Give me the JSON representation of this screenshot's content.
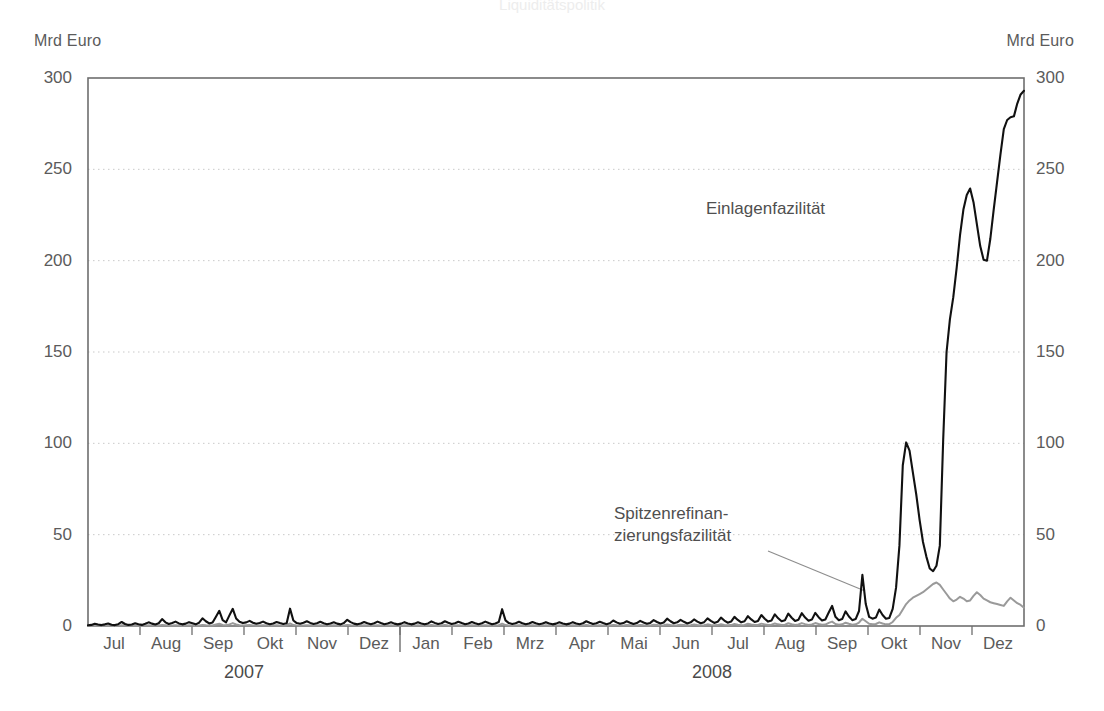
{
  "figure": {
    "faint_top_title": "Liquiditätspolitik",
    "unit_label_left": "Mrd Euro",
    "unit_label_right": "Mrd Euro"
  },
  "chart_data": {
    "type": "line",
    "title": "",
    "xlabel": "",
    "ylabel": "Mrd Euro",
    "ylim": [
      0,
      300
    ],
    "yticks": [
      0,
      50,
      100,
      150,
      200,
      250,
      300
    ],
    "ytick_labels": [
      "0",
      "50",
      "100",
      "150",
      "200",
      "250",
      "300"
    ],
    "grid": true,
    "grid_axis": "y",
    "legend_position": "inline-annotations",
    "x_tick_labels": [
      "Jul",
      "Aug",
      "Sep",
      "Okt",
      "Nov",
      "Dez",
      "Jan",
      "Feb",
      "Mrz",
      "Apr",
      "Mai",
      "Jun",
      "Jul",
      "Aug",
      "Sep",
      "Okt",
      "Nov",
      "Dez"
    ],
    "year_groups": [
      {
        "label": "2007",
        "start_index": 0,
        "end_index": 5
      },
      {
        "label": "2008",
        "start_index": 6,
        "end_index": 17
      }
    ],
    "colors": {
      "deposit_facility": "#111111",
      "marginal_lending_facility": "#9a9a9a"
    },
    "series": [
      {
        "name": "Einlagenfazilität",
        "color": "#111111",
        "annotation": "Einlagenfazilität",
        "values": [
          0.4,
          0.6,
          1.2,
          0.8,
          0.5,
          0.9,
          1.4,
          0.7,
          0.5,
          1.0,
          2.2,
          1.1,
          0.6,
          0.8,
          1.5,
          1.0,
          0.6,
          1.2,
          2.0,
          1.3,
          0.8,
          1.5,
          3.8,
          2.0,
          1.1,
          1.6,
          2.4,
          1.4,
          0.9,
          1.3,
          2.1,
          1.5,
          0.9,
          1.8,
          4.2,
          2.6,
          1.4,
          1.9,
          5.1,
          8.3,
          3.2,
          2.0,
          5.8,
          9.4,
          4.1,
          2.3,
          1.6,
          2.0,
          2.8,
          1.8,
          1.2,
          1.6,
          2.4,
          1.5,
          1.0,
          1.4,
          2.2,
          1.6,
          1.1,
          1.5,
          9.5,
          3.0,
          1.6,
          1.2,
          1.8,
          2.6,
          1.7,
          1.1,
          1.5,
          2.3,
          1.5,
          1.0,
          1.4,
          2.0,
          1.3,
          0.9,
          1.6,
          3.4,
          2.1,
          1.3,
          0.9,
          1.4,
          2.2,
          1.5,
          1.0,
          1.5,
          2.4,
          1.6,
          1.0,
          1.4,
          2.0,
          1.3,
          0.9,
          1.3,
          2.1,
          1.4,
          0.9,
          1.3,
          2.0,
          1.4,
          0.9,
          1.4,
          2.5,
          1.7,
          1.1,
          1.5,
          2.6,
          1.8,
          1.1,
          1.5,
          2.3,
          1.6,
          1.0,
          1.4,
          2.2,
          1.5,
          1.0,
          1.5,
          2.4,
          1.6,
          1.0,
          1.4,
          2.2,
          9.2,
          3.1,
          1.6,
          1.1,
          1.5,
          2.3,
          1.5,
          1.0,
          1.4,
          2.2,
          1.5,
          1.0,
          1.4,
          2.1,
          1.4,
          0.9,
          1.3,
          2.0,
          1.4,
          0.9,
          1.3,
          2.1,
          1.4,
          1.0,
          1.5,
          2.6,
          1.8,
          1.1,
          1.5,
          2.3,
          1.6,
          1.0,
          1.5,
          3.0,
          2.0,
          1.2,
          1.6,
          2.6,
          1.8,
          1.1,
          1.6,
          2.8,
          1.9,
          1.2,
          1.7,
          3.2,
          2.2,
          1.4,
          1.9,
          4.0,
          2.6,
          1.5,
          2.0,
          3.4,
          2.3,
          1.4,
          2.0,
          3.6,
          2.4,
          1.5,
          2.1,
          4.2,
          2.8,
          1.7,
          2.3,
          4.6,
          3.0,
          1.8,
          2.4,
          5.0,
          3.3,
          2.0,
          2.6,
          5.4,
          3.6,
          2.2,
          2.8,
          6.0,
          4.0,
          2.4,
          3.0,
          6.4,
          4.2,
          2.6,
          3.2,
          6.8,
          4.5,
          2.8,
          3.4,
          7.0,
          4.6,
          2.9,
          3.5,
          7.2,
          4.8,
          3.0,
          3.6,
          7.4,
          11.0,
          5.0,
          3.2,
          3.8,
          8.0,
          5.2,
          3.2,
          3.8,
          8.2,
          28.0,
          12.0,
          5.0,
          4.0,
          4.6,
          9.0,
          6.0,
          4.0,
          4.4,
          9.4,
          21.0,
          44.0,
          88.0,
          100.5,
          96.0,
          84.0,
          72.0,
          58.0,
          46.0,
          38.0,
          31.5,
          30.0,
          33.0,
          44.0,
          102.0,
          150.0,
          168.0,
          180.0,
          196.0,
          214.0,
          228.0,
          236.0,
          239.5,
          232.0,
          220.0,
          208.0,
          200.5,
          200.0,
          212.0,
          228.0,
          243.0,
          258.0,
          272.0,
          277.0,
          278.5,
          279.0,
          286.0,
          291.0,
          293.0
        ]
      },
      {
        "name": "Spitzenrefinanzierungsfazilität",
        "color": "#9a9a9a",
        "annotation": "Spitzenrefinan-\nzierungsfazilität",
        "values": [
          0.2,
          0.3,
          0.2,
          0.2,
          0.3,
          0.2,
          0.2,
          0.3,
          0.2,
          0.2,
          0.4,
          0.3,
          0.2,
          0.2,
          0.3,
          0.2,
          0.2,
          0.3,
          0.4,
          0.3,
          0.2,
          0.3,
          0.6,
          0.4,
          0.2,
          0.3,
          0.4,
          0.3,
          0.2,
          0.3,
          0.4,
          0.3,
          0.2,
          0.3,
          0.6,
          0.4,
          0.3,
          0.3,
          0.8,
          1.2,
          0.6,
          0.4,
          0.9,
          1.6,
          0.8,
          0.4,
          0.3,
          0.4,
          0.5,
          0.3,
          0.2,
          0.3,
          0.4,
          0.3,
          0.2,
          0.3,
          0.4,
          0.3,
          0.2,
          0.3,
          1.4,
          0.5,
          0.3,
          0.2,
          0.3,
          0.4,
          0.3,
          0.2,
          0.3,
          0.4,
          0.3,
          0.2,
          0.3,
          0.4,
          0.3,
          0.2,
          0.3,
          0.6,
          0.4,
          0.3,
          0.2,
          0.3,
          0.4,
          0.3,
          0.2,
          0.3,
          0.4,
          0.3,
          0.2,
          0.3,
          0.4,
          0.3,
          0.2,
          0.3,
          0.4,
          0.3,
          0.2,
          0.3,
          0.4,
          0.3,
          0.2,
          0.3,
          0.5,
          0.3,
          0.2,
          0.3,
          0.5,
          0.3,
          0.2,
          0.3,
          0.4,
          0.3,
          0.2,
          0.3,
          0.4,
          0.3,
          0.2,
          0.3,
          0.4,
          0.3,
          0.2,
          0.3,
          0.4,
          1.3,
          0.5,
          0.3,
          0.2,
          0.3,
          0.4,
          0.3,
          0.2,
          0.3,
          0.4,
          0.3,
          0.2,
          0.3,
          0.4,
          0.3,
          0.2,
          0.3,
          0.4,
          0.3,
          0.2,
          0.3,
          0.4,
          0.3,
          0.2,
          0.3,
          0.5,
          0.3,
          0.2,
          0.3,
          0.4,
          0.3,
          0.2,
          0.3,
          0.6,
          0.4,
          0.3,
          0.3,
          0.5,
          0.4,
          0.3,
          0.3,
          0.6,
          0.4,
          0.3,
          0.3,
          0.7,
          0.5,
          0.3,
          0.4,
          0.8,
          0.5,
          0.3,
          0.4,
          0.7,
          0.5,
          0.3,
          0.4,
          0.8,
          0.5,
          0.3,
          0.4,
          0.9,
          0.6,
          0.4,
          0.5,
          1.0,
          0.6,
          0.4,
          0.5,
          1.1,
          0.7,
          0.4,
          0.6,
          1.2,
          0.8,
          0.5,
          0.6,
          1.3,
          0.9,
          0.5,
          0.7,
          1.4,
          0.9,
          0.6,
          0.7,
          1.5,
          1.0,
          0.6,
          0.8,
          1.6,
          1.0,
          0.6,
          0.8,
          1.6,
          1.1,
          0.7,
          0.8,
          1.7,
          2.4,
          1.1,
          0.7,
          0.9,
          1.8,
          1.2,
          0.7,
          0.9,
          1.9,
          4.0,
          2.6,
          1.2,
          0.9,
          1.1,
          2.0,
          1.4,
          0.9,
          1.0,
          2.2,
          4.5,
          6.0,
          9.0,
          12.0,
          14.0,
          15.5,
          16.5,
          17.5,
          18.5,
          20.0,
          21.5,
          23.0,
          23.8,
          22.5,
          20.0,
          17.5,
          15.0,
          13.5,
          14.5,
          16.0,
          15.0,
          13.5,
          14.0,
          16.5,
          18.5,
          17.0,
          15.0,
          14.0,
          13.0,
          12.5,
          12.0,
          11.5,
          11.0,
          13.5,
          15.5,
          14.0,
          12.5,
          11.5,
          10.0
        ]
      }
    ]
  }
}
